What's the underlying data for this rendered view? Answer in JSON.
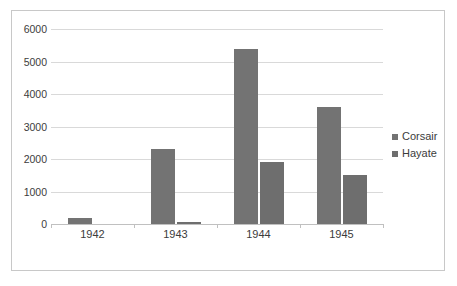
{
  "chart_data": {
    "type": "bar",
    "title": "",
    "xlabel": "",
    "ylabel": "",
    "categories": [
      "1942",
      "1943",
      "1944",
      "1945"
    ],
    "series": [
      {
        "name": "Corsair",
        "color": "#737373",
        "values": [
          180,
          2300,
          5400,
          3600
        ]
      },
      {
        "name": "Hayate",
        "color": "#6e6e6e",
        "values": [
          0,
          50,
          1900,
          1500
        ]
      }
    ],
    "ylim": [
      0,
      6000
    ],
    "ytick_labels": [
      "6000",
      "5000",
      "4000",
      "3000",
      "2000",
      "1000",
      "0"
    ],
    "ytick_values": [
      6000,
      5000,
      4000,
      3000,
      2000,
      1000,
      0
    ],
    "grid": true,
    "legend_position": "right"
  },
  "legend": {
    "items": [
      {
        "label": "Corsair",
        "marker": "square-marker"
      },
      {
        "label": "Hayate",
        "marker": "square-marker"
      }
    ]
  }
}
